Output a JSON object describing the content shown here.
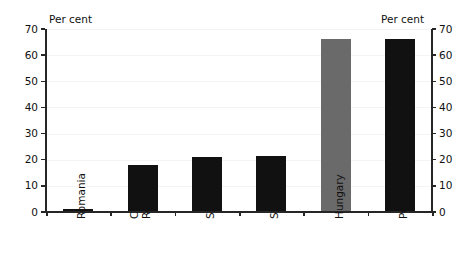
{
  "chart_data": {
    "type": "bar",
    "title": "",
    "subtitle": "",
    "xlabel": "",
    "ylabel": "Per cent",
    "ylabel_right": "Per cent",
    "ylim": [
      0,
      70
    ],
    "ytick_step": 10,
    "yticks": [
      0,
      10,
      20,
      30,
      40,
      50,
      60,
      70
    ],
    "ytick_labels": [
      "0",
      "10",
      "20",
      "30",
      "40",
      "50",
      "60",
      "70"
    ],
    "grid": true,
    "grid_axis": "y",
    "legend": false,
    "legend_position": "none",
    "dual_axis": true,
    "categories": [
      "Romania",
      "Czech Republic",
      "Slovenia",
      "Slovakia",
      "Hungary",
      "Poland"
    ],
    "category_label_lines": [
      [
        "Romania"
      ],
      [
        "Czech",
        "Republic"
      ],
      [
        "Slovenia"
      ],
      [
        "Slovakia"
      ],
      [
        "Hungary"
      ],
      [
        "Poland"
      ]
    ],
    "values": [
      1,
      18,
      21,
      21.3,
      66,
      66.3
    ],
    "bar_colors": [
      "#111111",
      "#111111",
      "#111111",
      "#111111",
      "#6a6a6a",
      "#111111"
    ],
    "highlight_category": "Hungary",
    "highlight_color": "#6a6a6a",
    "default_bar_color": "#111111"
  },
  "style": {
    "background": "#ffffff",
    "axis_color": "#262626",
    "grid_color": "#f4f4f6",
    "text_color": "#111111"
  }
}
